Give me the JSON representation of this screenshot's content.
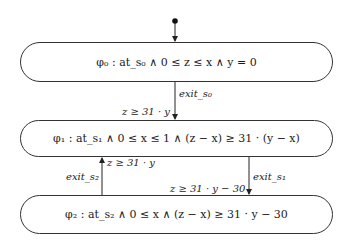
{
  "diagram": {
    "type": "state-transition",
    "initial_marker": "filled-dot",
    "states": [
      {
        "id": "s0",
        "label": "φ₀ :  at_s₀  ∧  0 ≤ z ≤ x  ∧  y = 0"
      },
      {
        "id": "s1",
        "label": "φ₁ :  at_s₁  ∧  0 ≤ x ≤ 1  ∧  (z − x) ≥ 31 · (y − x)"
      },
      {
        "id": "s2",
        "label": "φ₂ :  at_s₂  ∧  0 ≤ x  ∧  (z − x) ≥ 31 · y − 30"
      }
    ],
    "transitions": [
      {
        "from": "s0",
        "to": "s1",
        "action": "exit_s₀",
        "guard": "z ≥ 31 · y"
      },
      {
        "from": "s2",
        "to": "s1",
        "action": "exit_s₂",
        "guard": "z ≥ 31 · y"
      },
      {
        "from": "s1",
        "to": "s2",
        "action": "exit_s₁",
        "guard": "z ≥ 31 · y − 30"
      }
    ]
  }
}
